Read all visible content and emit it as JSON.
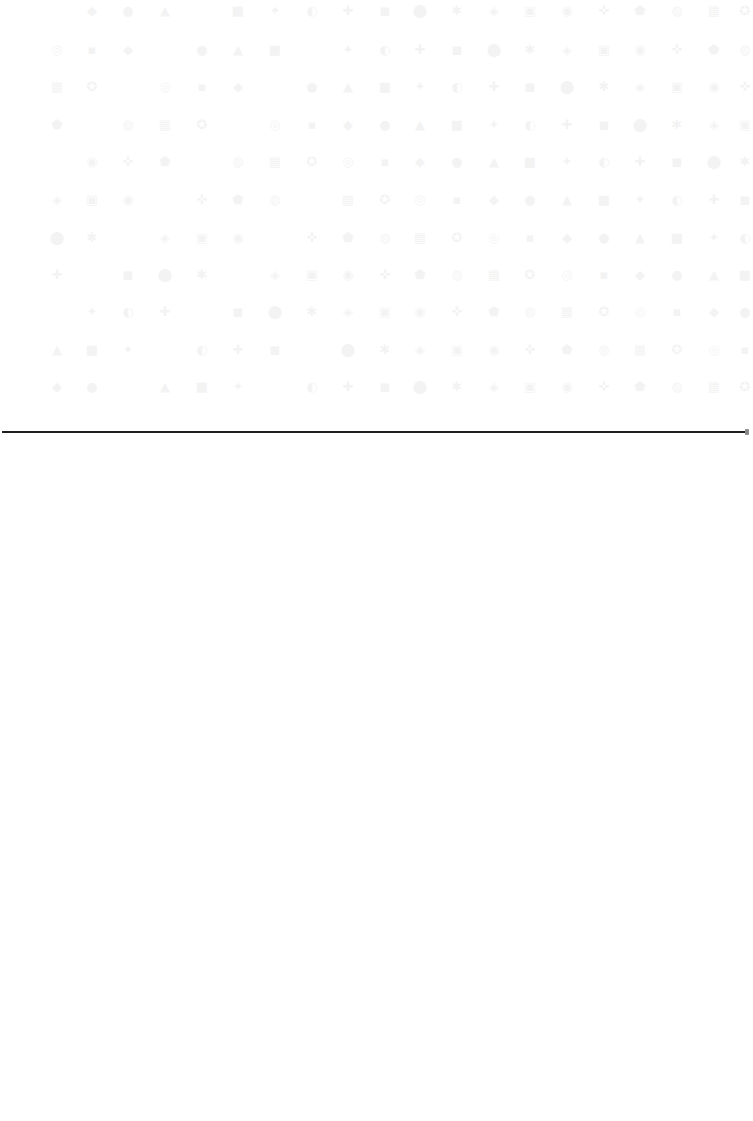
{
  "icon_grid": {
    "description": "faded icon grid (barely visible)",
    "columns_x": [
      57,
      92,
      128,
      165,
      202,
      238,
      275,
      312,
      348,
      385,
      420,
      457,
      494,
      530,
      567,
      604,
      640,
      677,
      714,
      745
    ],
    "rows_y": [
      11,
      50,
      87,
      125,
      162,
      200,
      238,
      275,
      312,
      350,
      387
    ],
    "glyphs": [
      "◆",
      "●",
      "▲",
      "■",
      "✦",
      "◐",
      "✚",
      "◼",
      "⬤",
      "✱",
      "◈",
      "▣",
      "◉",
      "✜",
      "⬟",
      "◍",
      "▦",
      "✪",
      "◎",
      "▪"
    ]
  },
  "divider": {
    "color": "#1e1e1e"
  },
  "content": {
    "lower_area_text": ""
  }
}
